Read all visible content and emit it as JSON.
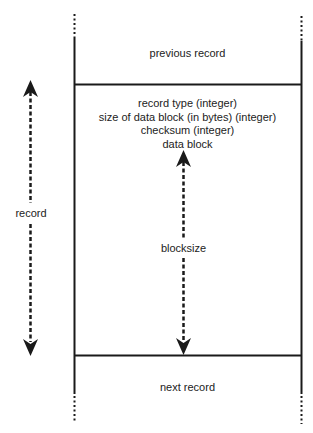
{
  "diagram": {
    "type": "record-layout",
    "previous_record_label": "previous record",
    "next_record_label": "next record",
    "record_fields": [
      "record type (integer)",
      "size of data block (in bytes) (integer)",
      "checksum (integer)",
      "data block"
    ],
    "record_span_label": "record",
    "blocksize_span_label": "blocksize",
    "colors": {
      "line": "#1a1a1a",
      "background": "#ffffff",
      "text": "#222222"
    }
  }
}
